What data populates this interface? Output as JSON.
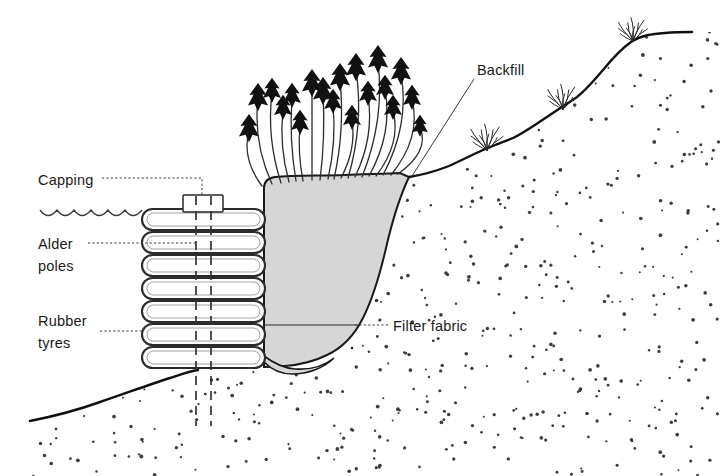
{
  "figure": {
    "background_color": "#ffffff",
    "line_color": "#111111",
    "backfill_fill_color": "#d6d6d6",
    "tyre_fill_color": "#ffffff",
    "soil_dot_color": "#3d3d3d"
  },
  "labels": {
    "capping": "Capping",
    "alder_poles_line1": "Alder",
    "alder_poles_line2": "poles",
    "rubber_tyres_line1": "Rubber",
    "rubber_tyres_line2": "tyres",
    "backfill": "Backfill",
    "filter_fabric": "Filter fabric"
  },
  "components": {
    "tyre_stack": {
      "rows": 7,
      "left_x": 142,
      "right_x": 265,
      "top_y": 209,
      "row_height": 23
    },
    "alder_poles": {
      "count": 2,
      "x_positions": [
        196,
        211
      ],
      "top_y": 196,
      "bottom_y": 426
    },
    "capping_cap": {
      "x": 183,
      "y": 195,
      "width": 40,
      "height": 17
    },
    "water_line": {
      "from_x": 40,
      "to_x": 142,
      "y": 213,
      "wave_count": 6
    },
    "vegetation": {
      "shoot_count": 19,
      "description": "dark arrowhead leaf clusters on thin curved stems",
      "grass_tuft_count": 3
    },
    "filter_fabric_line_y": 325
  },
  "icon_names": {
    "water_surface": "water-wave-icon",
    "plant": "plant-shoot-icon",
    "grass": "grass-tuft-icon",
    "soil": "soil-stipple-icon"
  }
}
